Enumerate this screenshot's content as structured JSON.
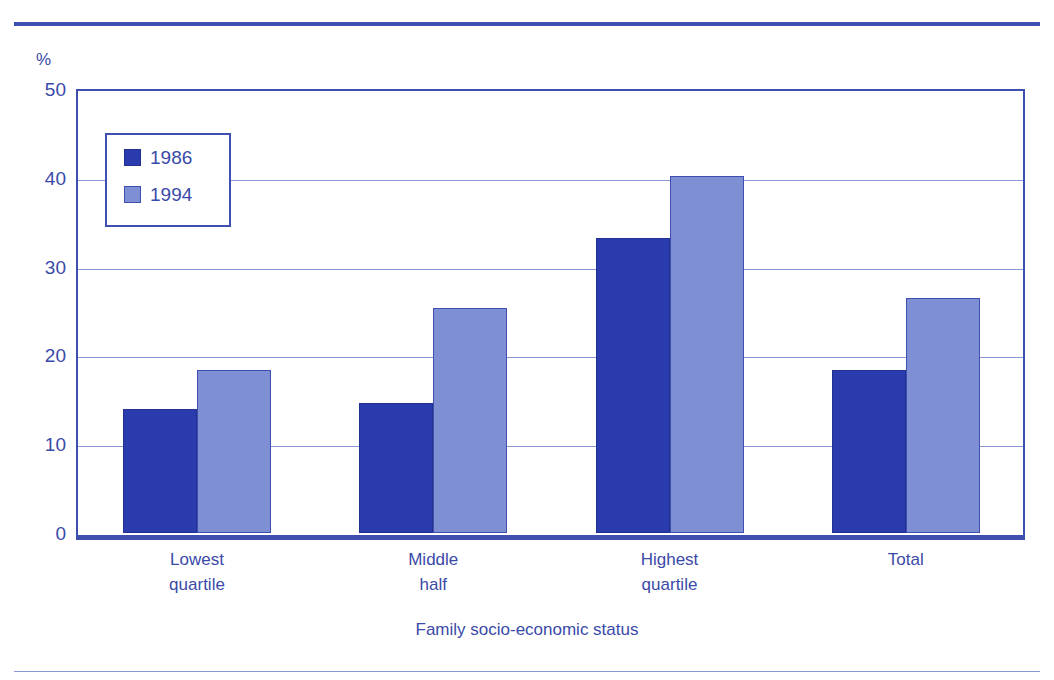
{
  "chart_data": {
    "type": "bar",
    "title": "",
    "xlabel": "Family socio-economic status",
    "ylabel": "%",
    "categories": [
      "Lowest quartile",
      "Middle half",
      "Highest quartile",
      "Total"
    ],
    "category_lines": [
      [
        "Lowest",
        "quartile"
      ],
      [
        "Middle",
        "half"
      ],
      [
        "Highest",
        "quartile"
      ],
      [
        "Total"
      ]
    ],
    "series": [
      {
        "name": "1986",
        "color": "#2a3cad",
        "values": [
          14.0,
          14.6,
          33.2,
          18.4
        ]
      },
      {
        "name": "1994",
        "color": "#7e8fd4",
        "values": [
          18.4,
          25.3,
          40.2,
          26.5
        ]
      }
    ],
    "ylim": [
      0,
      50
    ],
    "yticks": [
      50,
      40,
      30,
      20,
      10,
      0
    ],
    "ytick_labels": [
      "50",
      "40",
      "30",
      "20",
      "10",
      "0"
    ],
    "grid": true,
    "legend_position": "upper-left-inside"
  },
  "axis": {
    "unit_label": "%"
  },
  "legend": {
    "entries": [
      {
        "label": "1986"
      },
      {
        "label": "1994"
      }
    ]
  },
  "colors": {
    "series_1986": "#2a3cad",
    "series_1994": "#7e8fd4",
    "axis": "#3e4fb0",
    "grid": "#8a97d6",
    "text": "#3a4aa8",
    "background": "#ffffff"
  }
}
